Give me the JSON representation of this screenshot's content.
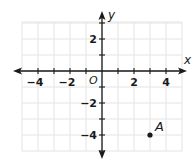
{
  "figure": {
    "type": "coordinate-plane",
    "axes": {
      "x_label": "x",
      "y_label": "y",
      "origin_label": "O"
    },
    "grid": {
      "x_min": -5,
      "x_max": 5,
      "y_min": -5,
      "y_max": 3,
      "step": 1
    },
    "x_tick_labels": [
      {
        "value": -4,
        "text": "−4"
      },
      {
        "value": -2,
        "text": "−2"
      },
      {
        "value": 2,
        "text": "2"
      },
      {
        "value": 4,
        "text": "4"
      }
    ],
    "y_tick_labels": [
      {
        "value": 2,
        "text": "2"
      },
      {
        "value": -2,
        "text": "−2"
      },
      {
        "value": -4,
        "text": "−4"
      }
    ],
    "points": [
      {
        "label": "A",
        "x": 3,
        "y": -4
      }
    ],
    "colors": {
      "grid": "#e4e4e4",
      "axis": "#1a1a1a",
      "point": "#1a1a1a"
    }
  }
}
